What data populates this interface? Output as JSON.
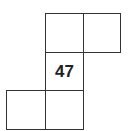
{
  "diagram": {
    "cells": [
      {
        "row": 0,
        "col": 1,
        "label": ""
      },
      {
        "row": 0,
        "col": 2,
        "label": ""
      },
      {
        "row": 1,
        "col": 1,
        "label": "47"
      },
      {
        "row": 2,
        "col": 0,
        "label": ""
      },
      {
        "row": 2,
        "col": 1,
        "label": ""
      }
    ]
  }
}
